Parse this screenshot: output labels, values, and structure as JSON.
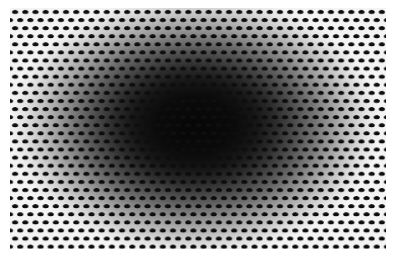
{
  "figure": {
    "kind": "optical-illusion",
    "name": "halftone-dot-radial-gradient-illusion",
    "width": 397,
    "height": 261,
    "page_background": "#ffffff",
    "caption": "",
    "label": ""
  },
  "plate": {
    "left": 10,
    "top": 8,
    "width": 376,
    "height": 241,
    "margin_left": 10,
    "margin_top": 8,
    "margin_right": 11,
    "margin_bottom": 12
  },
  "gradient": {
    "type": "radial-ellipse",
    "center_x": 195,
    "center_y": 125,
    "radius_x": 185,
    "radius_y": 132,
    "core_half_width": 70,
    "core_half_height": 66,
    "stops": [
      {
        "offset": "0%",
        "color": "#050505"
      },
      {
        "offset": "22%",
        "color": "#0a0a0a"
      },
      {
        "offset": "34%",
        "color": "#161616"
      },
      {
        "offset": "44%",
        "color": "#2b2b2b"
      },
      {
        "offset": "54%",
        "color": "#4a4a4a"
      },
      {
        "offset": "64%",
        "color": "#6f6f6f"
      },
      {
        "offset": "74%",
        "color": "#9a9a9a"
      },
      {
        "offset": "84%",
        "color": "#c4c4c4"
      },
      {
        "offset": "93%",
        "color": "#e4e4e4"
      },
      {
        "offset": "100%",
        "color": "#f4f4f4"
      }
    ],
    "edge_color": "#f4f4f4",
    "center_color": "#050505"
  },
  "dots": {
    "shape": "ellipse",
    "color": "#0d0d0d",
    "spacing_x": 10.2,
    "spacing_y": 8.1,
    "row_offset_x": 5.1,
    "diameter_x": 7.2,
    "diameter_y": 4.6,
    "columns": 38,
    "rows": 30,
    "arrangement": "staggered-hexagonal",
    "blur": 0.35
  },
  "palette": {
    "white": "#ffffff",
    "paper": "#f4f4f4",
    "dot_black": "#0d0d0d",
    "core_black": "#050505",
    "mid_gray": "#6f6f6f"
  }
}
